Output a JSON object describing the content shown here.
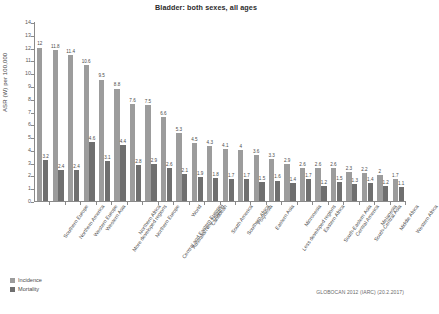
{
  "chart_data": {
    "type": "bar",
    "title": "Bladder: both sexes, all ages",
    "xlabel": "",
    "ylabel": "ASR (W) per 100,000",
    "ylim": [
      0,
      14
    ],
    "ytick_values": [
      0,
      1,
      2,
      3,
      4,
      5,
      6,
      7,
      8,
      9,
      10,
      11,
      12,
      13,
      14
    ],
    "ytick_labels": [
      "0",
      "1",
      "2",
      "3",
      "4",
      "5",
      "6",
      "7",
      "8",
      "9",
      "10",
      "11",
      "12",
      "13",
      "14"
    ],
    "grid": false,
    "legend_position": "bottom-left",
    "categories": [
      "Southern Europe",
      "Northern America",
      "Western Europe",
      "Western Asia",
      "More developed regions",
      "Northern Africa",
      "Northern Europe",
      "Central and Eastern Europe",
      "Australia/New Zealand",
      "World",
      "Caribbean",
      "South America",
      "Southern Africa",
      "Polynesia",
      "Eastern Asia",
      "Less developed regions",
      "Micronesia",
      "Eastern Africa",
      "South-Eastern Asia",
      "Central America",
      "South-Central Asia",
      "Melanesia",
      "Middle Africa",
      "Western Africa"
    ],
    "series": [
      {
        "name": "Incidence",
        "color": "#9c9c9c",
        "values": [
          12,
          11.8,
          11.4,
          10.6,
          9.5,
          8.8,
          7.6,
          7.5,
          6.6,
          5.3,
          4.5,
          4.3,
          4.1,
          4,
          3.6,
          3.3,
          2.9,
          2.6,
          2.6,
          2.6,
          2.3,
          2.2,
          2,
          1.7
        ],
        "labels": [
          "12",
          "11.8",
          "11.4",
          "10.6",
          "9.5",
          "8.8",
          "7.6",
          "7.5",
          "6.6",
          "5.3",
          "4.5",
          "4.3",
          "4.1",
          "4",
          "3.6",
          "3.3",
          "2.9",
          "2.6",
          "2.6",
          "2.6",
          "2.3",
          "2.2",
          "2",
          "1.7"
        ]
      },
      {
        "name": "Mortality",
        "color": "#6f6f6f",
        "values": [
          3.2,
          2.4,
          2.4,
          4.6,
          3.1,
          4.4,
          2.8,
          2.9,
          2.6,
          2.1,
          1.9,
          1.8,
          1.7,
          1.7,
          1.5,
          1.6,
          1.4,
          1.7,
          1.2,
          1.5,
          1.3,
          1.4,
          1.2,
          1.1
        ],
        "labels": [
          "3.2",
          "2.4",
          "2.4",
          "4.6",
          "3.1",
          "4.4",
          "2.8",
          "2.9",
          "2.6",
          "2.1",
          "1.9",
          "1.8",
          "1.7",
          "1.7",
          "1.5",
          "1.6",
          "1.4",
          "1.7",
          "1.2",
          "1.5",
          "1.3",
          "1.4",
          "1.2",
          "1.1"
        ]
      }
    ],
    "last_category_value": 1.6,
    "source_note": "GLOBOCAN 2012 (IARC) (20.2.2017)"
  },
  "legend": {
    "items": [
      {
        "label": "Incidence",
        "color": "#9c9c9c"
      },
      {
        "label": "Mortality",
        "color": "#6f6f6f"
      }
    ]
  }
}
